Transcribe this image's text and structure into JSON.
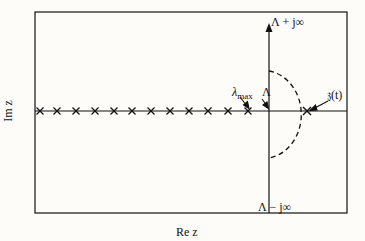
{
  "diagram": {
    "labels": {
      "top_pole": "Λ + j∞",
      "bottom_pole": "Λ − j∞",
      "lambda_max": "λ",
      "lambda_max_sub": "max",
      "lambda_cap": "Λ",
      "z_t": "𝔷(t)",
      "x_axis": "Re z",
      "y_axis": "Im z"
    },
    "cross_x_positions": [
      40,
      57,
      76,
      95,
      114,
      132,
      151,
      170,
      189,
      208,
      228,
      248
    ],
    "colors": {
      "ink": "#111111",
      "background": "#fdfcf8"
    }
  }
}
